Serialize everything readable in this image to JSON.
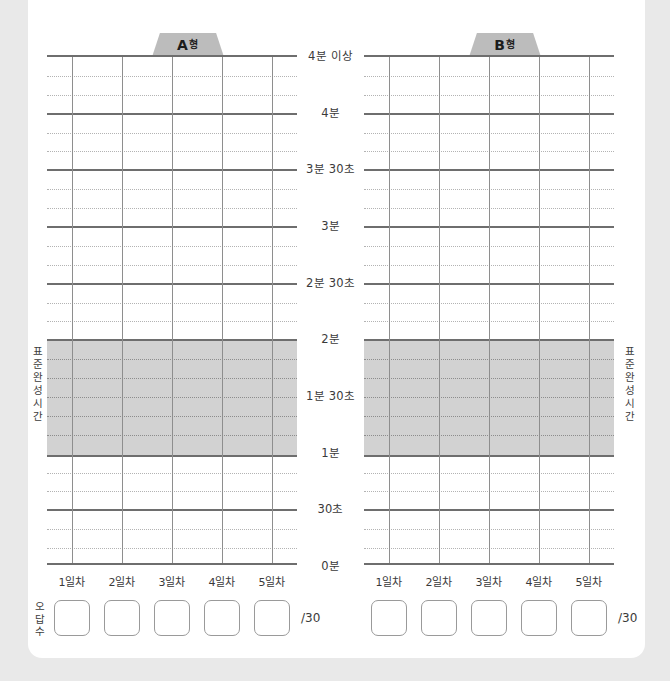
{
  "worksheet": {
    "side_label_text": "표준완성시간",
    "wrong_count_label_text": "오답수",
    "answer_total_suffix": "/30"
  },
  "tabs": [
    {
      "id": "a",
      "letter": "A",
      "suffix": "형"
    },
    {
      "id": "b",
      "letter": "B",
      "suffix": "형"
    }
  ],
  "axis": {
    "tick_labels": [
      "4분 이상",
      "4분",
      "3분 30초",
      "3분",
      "2분 30초",
      "2분",
      "1분 30초",
      "1분",
      "30초",
      "0분"
    ],
    "day_labels": [
      "1일차",
      "2일차",
      "3일차",
      "4일차",
      "5일차"
    ]
  },
  "chart_data": {
    "type": "line",
    "title": "",
    "subtitle": "",
    "xlabel": "",
    "ylabel": "표준완성시간",
    "grid": true,
    "legend": "none",
    "x": [
      "1일차",
      "2일차",
      "3일차",
      "4일차",
      "5일차"
    ],
    "y_tick_labels": [
      "0분",
      "30초",
      "1분",
      "1분 30초",
      "2분",
      "2분 30초",
      "3분",
      "3분 30초",
      "4분",
      "4분 이상"
    ],
    "y_tick_values_sec": [
      0,
      30,
      60,
      90,
      120,
      150,
      180,
      210,
      240,
      270
    ],
    "ylim_sec": [
      0,
      270
    ],
    "y_minor_step_sec": 10,
    "shaded_band": {
      "label": "표준완성시간",
      "from_sec": 60,
      "to_sec": 120,
      "from_label": "1분",
      "to_label": "2분",
      "color": "#d2d2d2"
    },
    "series": [
      {
        "name": "A형",
        "values": [
          null,
          null,
          null,
          null,
          null
        ]
      },
      {
        "name": "B형",
        "values": [
          null,
          null,
          null,
          null,
          null
        ]
      }
    ],
    "note": "Blank practice chart — no plotted data points; user fills in."
  },
  "colors": {
    "page_background": "#e9e9e9",
    "sheet": "#ffffff",
    "major_line": "#6e6e6e",
    "minor_line": "#b3b3b3",
    "vertical_line": "#8e8e8e",
    "band_fill": "#d2d2d2",
    "tab_fill": "#bcbcbc",
    "text": "#3a3a3a"
  }
}
